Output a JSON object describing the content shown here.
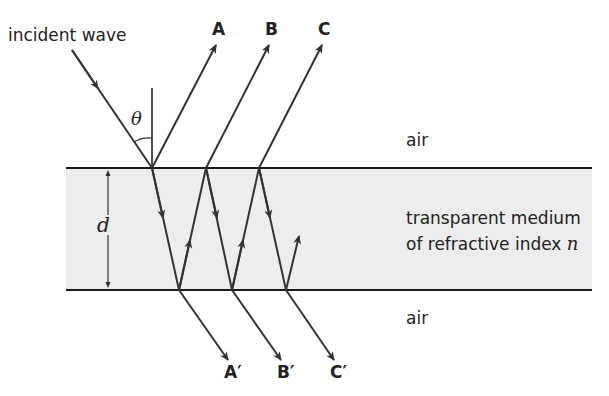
{
  "diagram": {
    "labels": {
      "incident": "incident wave",
      "theta": "θ",
      "air_top": "air",
      "air_bottom": "air",
      "medium_line1": "transparent medium",
      "medium_line2_prefix": "of refractive index ",
      "medium_n": "n",
      "thickness": "d",
      "reflected": [
        "A",
        "B",
        "C"
      ],
      "transmitted": [
        "A′",
        "B′",
        "C′"
      ]
    },
    "colors": {
      "line": "#2b2b2b",
      "medium_fill": "#ededed",
      "background": "#ffffff"
    }
  }
}
